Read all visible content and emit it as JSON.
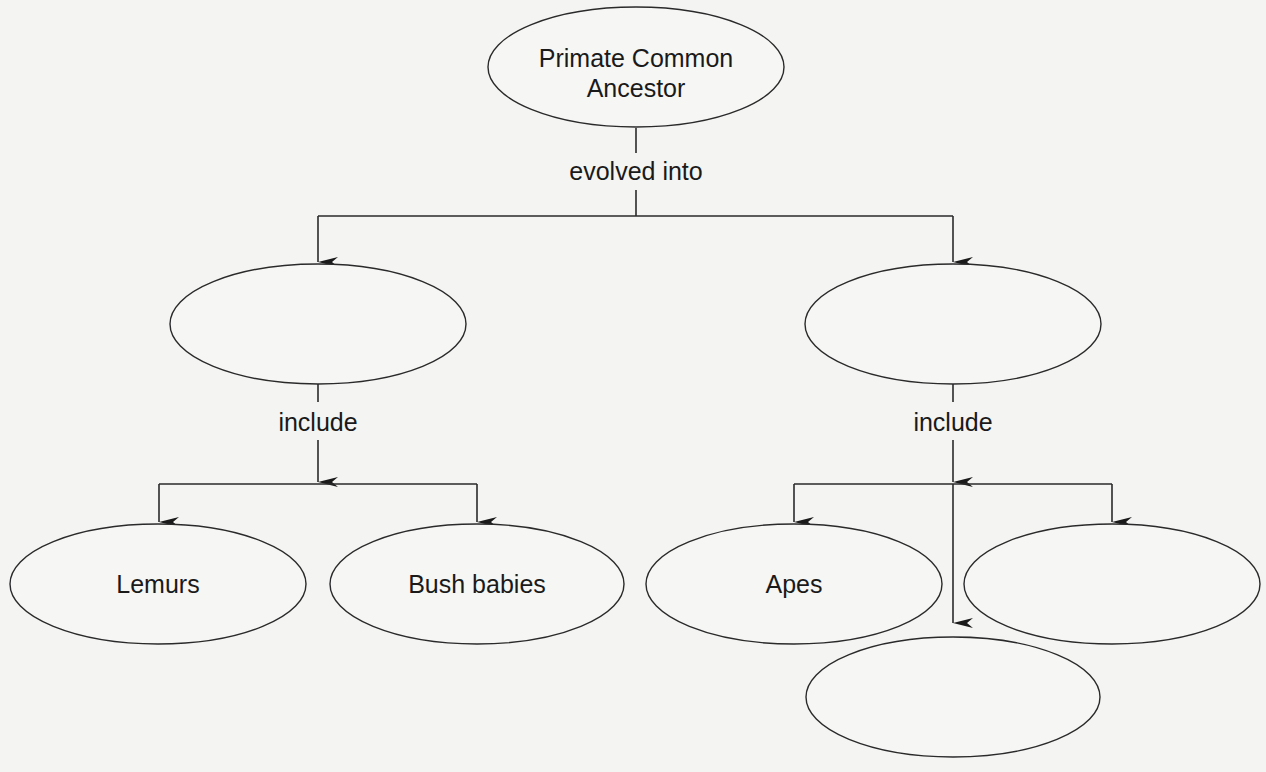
{
  "diagram": {
    "type": "concept-map",
    "nodes": {
      "root": {
        "line1": "Primate Common",
        "line2": "Ancestor"
      },
      "group_left": {
        "label": ""
      },
      "group_right": {
        "label": ""
      },
      "lemurs": {
        "label": "Lemurs"
      },
      "bush_babies": {
        "label": "Bush babies"
      },
      "apes": {
        "label": "Apes"
      },
      "right_blank": {
        "label": ""
      },
      "bottom_blank": {
        "label": ""
      }
    },
    "links": {
      "root_to_groups": "evolved into",
      "left_include": "include",
      "right_include": "include"
    },
    "colors": {
      "stroke": "#2a2a2a",
      "text": "#1a1a1a",
      "background": "#f4f4f3"
    }
  }
}
